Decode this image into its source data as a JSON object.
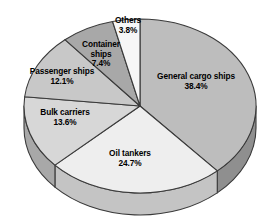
{
  "chart_data": {
    "type": "pie",
    "title": "",
    "subtitle": "",
    "xlabel": "",
    "ylabel": "",
    "legend_position": "none",
    "grid": false,
    "value_unit": "%",
    "start_angle_deg": -90,
    "direction": "clockwise",
    "three_d": true,
    "categories": [
      "General cargo ships",
      "Oil tankers",
      "Bulk carriers",
      "Passenger ships",
      "Container ships",
      "Others"
    ],
    "values": [
      38.4,
      24.7,
      13.6,
      12.1,
      7.4,
      3.8
    ],
    "slices": [
      {
        "label": "General cargo ships",
        "value": 38.4,
        "value_text": "38.4%",
        "color": "#bdbdbd",
        "side_color": "#8f8f8f",
        "label_x": 196,
        "label_y": 72,
        "label_width": 100
      },
      {
        "label": "Oil tankers",
        "value": 24.7,
        "value_text": "24.7%",
        "color": "#eeeeee",
        "side_color": "#c4c4c4",
        "label_x": 130,
        "label_y": 149,
        "label_width": 78
      },
      {
        "label": "Bulk carriers",
        "value": 13.6,
        "value_text": "13.6%",
        "color": "#d7d7d7",
        "side_color": "#a8a8a8",
        "label_x": 65,
        "label_y": 108,
        "label_width": 80
      },
      {
        "label": "Passenger ships",
        "value": 12.1,
        "value_text": "12.1%",
        "color": "#c8c8c8",
        "side_color": "#9b9b9b",
        "label_x": 62,
        "label_y": 67,
        "label_width": 96
      },
      {
        "label": "Container\nships",
        "value": 7.4,
        "value_text": "7.4%",
        "color": "#a8a8a8",
        "side_color": "#828282",
        "label_x": 101,
        "label_y": 40,
        "label_width": 56
      },
      {
        "label": "Others",
        "value": 3.8,
        "value_text": "3.8%",
        "color": "#f6f6f6",
        "side_color": "#cccccc",
        "label_x": 128,
        "label_y": 16,
        "label_width": 46
      }
    ],
    "geometry": {
      "center_x": 140,
      "center_y": 106,
      "radius_x": 116,
      "radius_y": 87,
      "depth": 22
    },
    "style": {
      "background": "#ffffff",
      "outline": "#3a3a3a",
      "label_color": "#000000"
    }
  }
}
